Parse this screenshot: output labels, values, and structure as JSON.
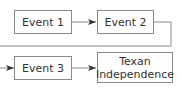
{
  "diagram": {
    "type": "flowchart",
    "nodes": [
      {
        "id": "event1",
        "label": "Event 1"
      },
      {
        "id": "event2",
        "label": "Event 2"
      },
      {
        "id": "event3",
        "label": "Event 3"
      },
      {
        "id": "texan",
        "label": "Texan Independence",
        "lines": [
          "Texan",
          "Independence"
        ]
      }
    ],
    "edges": [
      {
        "from": "event1",
        "to": "event2"
      },
      {
        "from": "event2",
        "to": "event3"
      },
      {
        "from": "event3",
        "to": "texan"
      }
    ],
    "colors": {
      "stroke": "#8a8a8a",
      "arrow": "#333333",
      "text": "#333333"
    }
  }
}
